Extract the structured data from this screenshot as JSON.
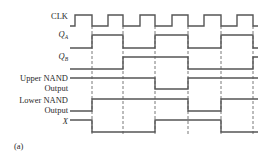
{
  "figure": {
    "caption": "(a)",
    "line_color": "#555555",
    "text_color": "#2a2a2a",
    "x_start": 70,
    "x_end": 258,
    "edges": [
      75,
      92,
      108,
      123,
      140,
      155,
      172,
      188,
      204,
      221,
      237,
      253
    ],
    "dashed_times": [
      92,
      123,
      155,
      188,
      221,
      253
    ],
    "dashed_y_range": [
      26,
      134
    ],
    "signals": [
      {
        "id": "clk",
        "label_lines": [
          "CLK"
        ],
        "italic": false,
        "subscript": "",
        "label_y": [
          19
        ],
        "y_high": 15,
        "y_low": 26,
        "initial": 0,
        "transitions": [
          75,
          92,
          108,
          123,
          140,
          155,
          172,
          188,
          204,
          221,
          237,
          253
        ]
      },
      {
        "id": "qa",
        "label_lines": [
          "Q"
        ],
        "italic": true,
        "subscript": "A",
        "label_y": [
          37
        ],
        "y_high": 35,
        "y_low": 48,
        "initial": 0,
        "transitions": [
          92,
          123,
          155,
          188,
          221,
          253
        ]
      },
      {
        "id": "qb",
        "label_lines": [
          "Q"
        ],
        "italic": true,
        "subscript": "B",
        "label_y": [
          59
        ],
        "y_high": 57,
        "y_low": 69,
        "initial": 0,
        "transitions": [
          123,
          188,
          253
        ]
      },
      {
        "id": "upper-nand",
        "label_lines": [
          "Upper NAND",
          "Output"
        ],
        "italic": false,
        "subscript": "",
        "label_y": [
          81,
          91
        ],
        "y_high": 78,
        "y_low": 89,
        "initial": 1,
        "transitions": [
          155,
          188
        ]
      },
      {
        "id": "lower-nand",
        "label_lines": [
          "Lower NAND",
          "Output"
        ],
        "italic": false,
        "subscript": "",
        "label_y": [
          103,
          113
        ],
        "y_high": 99,
        "y_low": 111,
        "initial": 0,
        "transitions": [
          92,
          188,
          221
        ]
      },
      {
        "id": "x",
        "label_lines": [
          "X"
        ],
        "italic": true,
        "subscript": "",
        "label_y": [
          124
        ],
        "y_high": 120,
        "y_low": 132,
        "initial": 1,
        "transitions": [
          92,
          155,
          221
        ]
      }
    ]
  }
}
